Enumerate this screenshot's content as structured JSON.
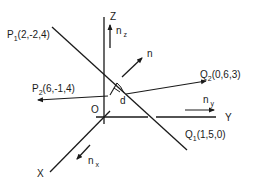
{
  "figure": {
    "colors": {
      "stroke": "#1a1a1a",
      "background": "#ffffff"
    }
  },
  "axes": {
    "origin_label": "O",
    "x_label": "X",
    "y_label": "Y",
    "z_label": "Z"
  },
  "unit_vectors": {
    "nx": {
      "base": "n",
      "sub": "x"
    },
    "ny": {
      "base": "n",
      "sub": "y"
    },
    "nz": {
      "base": "n",
      "sub": "z"
    },
    "n": {
      "base": "n"
    }
  },
  "points": {
    "P1": {
      "base": "P",
      "sub": "1",
      "coords": "(2,-2,4)"
    },
    "P2": {
      "base": "P",
      "sub": "2",
      "coords": "(6,-1,4)"
    },
    "Q1": {
      "base": "Q",
      "sub": "1",
      "coords": "(1,5,0)"
    },
    "Q2": {
      "base": "Q",
      "sub": "2",
      "coords": "(0,6,3)"
    }
  },
  "distance_label": "d"
}
